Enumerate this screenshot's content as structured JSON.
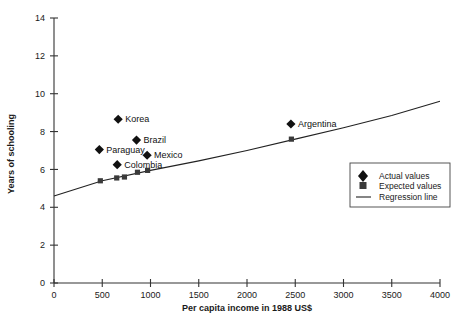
{
  "chart_data": {
    "type": "scatter",
    "title": "",
    "xlabel": "Per capita income in 1988 US$",
    "ylabel": "Years of schooling",
    "xlim": [
      0,
      4000
    ],
    "ylim": [
      0,
      14
    ],
    "xticks": [
      0,
      500,
      1000,
      1500,
      2000,
      2500,
      3000,
      3500,
      4000
    ],
    "yticks": [
      0,
      2,
      4,
      6,
      8,
      10,
      12,
      14
    ],
    "grid": false,
    "legend_position": "bottom-right",
    "series": [
      {
        "name": "Actual values",
        "marker": "diamond",
        "points": [
          {
            "label": "Paraguay",
            "x": 470,
            "y": 7.05
          },
          {
            "label": "Korea",
            "x": 665,
            "y": 8.65
          },
          {
            "label": "Colombia",
            "x": 655,
            "y": 6.25
          },
          {
            "label": "Brazil",
            "x": 855,
            "y": 7.55
          },
          {
            "label": "Mexico",
            "x": 965,
            "y": 6.75
          },
          {
            "label": "Argentina",
            "x": 2455,
            "y": 8.4
          }
        ]
      },
      {
        "name": "Expected values",
        "marker": "square",
        "points": [
          {
            "label": "",
            "x": 480,
            "y": 5.4
          },
          {
            "label": "",
            "x": 650,
            "y": 5.55
          },
          {
            "label": "",
            "x": 730,
            "y": 5.6
          },
          {
            "label": "",
            "x": 865,
            "y": 5.85
          },
          {
            "label": "",
            "x": 970,
            "y": 5.95
          },
          {
            "label": "",
            "x": 2460,
            "y": 7.6
          }
        ]
      },
      {
        "name": "Regression line",
        "marker": "line",
        "points": [
          {
            "x": 0,
            "y": 4.6
          },
          {
            "x": 500,
            "y": 5.4
          },
          {
            "x": 1000,
            "y": 5.95
          },
          {
            "x": 1500,
            "y": 6.45
          },
          {
            "x": 2000,
            "y": 7.0
          },
          {
            "x": 2500,
            "y": 7.6
          },
          {
            "x": 3000,
            "y": 8.2
          },
          {
            "x": 3500,
            "y": 8.85
          },
          {
            "x": 4000,
            "y": 9.6
          }
        ]
      }
    ],
    "point_labels": [
      "Korea",
      "Brazil",
      "Paraguay",
      "Mexico",
      "Colombia",
      "Argentina"
    ]
  },
  "axes": {
    "x_title": "Per capita income in 1988 US$",
    "y_title": "Years of schooling",
    "x_tick_labels": [
      "0",
      "500",
      "1000",
      "1500",
      "2000",
      "2500",
      "3000",
      "3500",
      "4000"
    ],
    "y_tick_labels": [
      "0",
      "2",
      "4",
      "6",
      "8",
      "10",
      "12",
      "14"
    ]
  },
  "legend": {
    "items": [
      {
        "label": "Actual values",
        "marker": "diamond-marker"
      },
      {
        "label": "Expected values",
        "marker": "square-marker"
      },
      {
        "label": "Regression line",
        "marker": "line-marker"
      }
    ]
  },
  "labels": {
    "korea": "Korea",
    "brazil": "Brazil",
    "paraguay": "Paraguay",
    "mexico": "Mexico",
    "colombia": "Colombia",
    "argentina": "Argentina"
  },
  "colors": {
    "marker_actual": "#111111",
    "marker_expected": "#3a3a3a",
    "line": "#222222",
    "axis": "#333333",
    "background": "#ffffff"
  }
}
